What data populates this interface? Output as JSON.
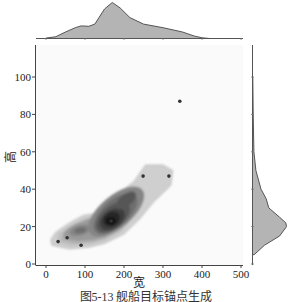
{
  "chart_data": {
    "type": "scatter",
    "subtype": "jointplot-kde",
    "title": "",
    "caption": "图5-13 舰船目标锚点生成",
    "xlabel": "宽",
    "ylabel": "高",
    "xlim": [
      -25,
      505
    ],
    "ylim": [
      0,
      118
    ],
    "xticks": [
      0,
      100,
      200,
      300,
      400,
      500
    ],
    "yticks": [
      0,
      20,
      40,
      60,
      80,
      100
    ],
    "grid": false,
    "legend": null,
    "points": [
      {
        "x": 31,
        "y": 12
      },
      {
        "x": 54,
        "y": 14
      },
      {
        "x": 90,
        "y": 10
      },
      {
        "x": 167,
        "y": 23
      },
      {
        "x": 249,
        "y": 47
      },
      {
        "x": 315,
        "y": 47
      },
      {
        "x": 343,
        "y": 87
      }
    ],
    "kde_2d": {
      "levels": 10,
      "peak_main": {
        "x": 168,
        "y": 24
      },
      "peak_secondary": {
        "x": 90,
        "y": 18
      },
      "peak_tertiary": {
        "x": 205,
        "y": 34
      },
      "color_low": "#c8c8c8",
      "color_high": "#111111"
    },
    "marginal_x": {
      "type": "kde",
      "x": [
        0,
        25,
        50,
        75,
        90,
        110,
        125,
        150,
        170,
        190,
        215,
        250,
        300,
        350,
        380,
        400,
        420
      ],
      "density": [
        0.01,
        0.05,
        0.18,
        0.3,
        0.35,
        0.34,
        0.4,
        0.82,
        1.0,
        0.85,
        0.58,
        0.4,
        0.3,
        0.18,
        0.07,
        0.02,
        0.0
      ]
    },
    "marginal_y": {
      "type": "kde",
      "y": [
        5,
        10,
        15,
        20,
        22,
        25,
        30,
        35,
        40,
        50,
        60,
        80,
        100
      ],
      "density": [
        0.05,
        0.35,
        0.8,
        1.0,
        0.98,
        0.8,
        0.48,
        0.4,
        0.25,
        0.1,
        0.04,
        0.02,
        0.01
      ]
    },
    "colors": {
      "fill": "#b4b4b4",
      "line": "#555555",
      "point": "#333333",
      "axis": "#444444"
    }
  }
}
